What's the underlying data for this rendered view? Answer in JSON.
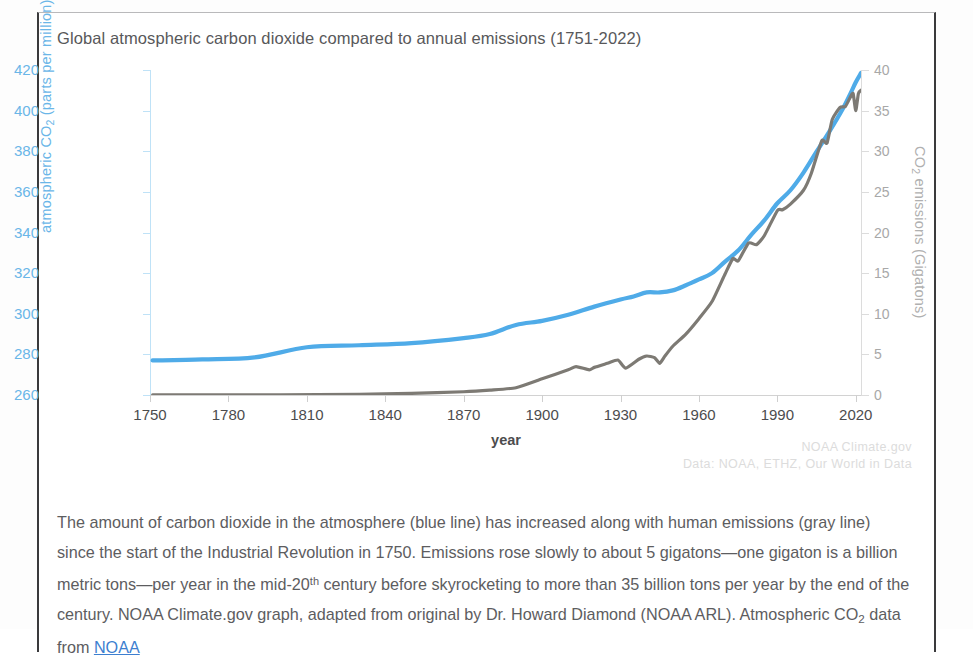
{
  "chart_data": {
    "type": "line",
    "title": "Global atmospheric carbon dioxide compared to annual emissions (1751-2022)",
    "xlabel": "year",
    "ylabel_left": "atmospheric CO₂ (parts per million)",
    "ylabel_right": "CO₂ emissions (Gigatons)",
    "xlim": [
      1750,
      2022
    ],
    "ylim_left": [
      260,
      420
    ],
    "ylim_right": [
      0,
      40
    ],
    "xticks": [
      1750,
      1780,
      1810,
      1840,
      1870,
      1900,
      1930,
      1960,
      1990,
      2020
    ],
    "yticks_left": [
      260,
      280,
      300,
      320,
      340,
      360,
      380,
      400,
      420
    ],
    "yticks_right": [
      0,
      5,
      10,
      15,
      20,
      25,
      30,
      35,
      40
    ],
    "grid": false,
    "legend_position": "none",
    "colors": {
      "co2_line": "#4FABE8",
      "emissions_line": "#7d7a74",
      "left_axis": "#6ab6e8",
      "right_axis": "#b0b0b0"
    },
    "series": [
      {
        "name": "atmospheric CO2 (ppm)",
        "axis": "left",
        "color": "#4FABE8",
        "x": [
          1751,
          1770,
          1790,
          1810,
          1830,
          1850,
          1870,
          1880,
          1890,
          1900,
          1910,
          1920,
          1930,
          1935,
          1940,
          1945,
          1950,
          1955,
          1960,
          1965,
          1970,
          1975,
          1980,
          1985,
          1990,
          1995,
          2000,
          2005,
          2010,
          2015,
          2018,
          2020,
          2022
        ],
        "y": [
          277,
          277.5,
          278.5,
          283.5,
          284.5,
          285.5,
          288,
          290,
          294.5,
          296.5,
          299.5,
          303.5,
          307,
          308.5,
          310.5,
          310.5,
          311.5,
          314,
          316.9,
          320,
          325.7,
          331.1,
          338.8,
          346,
          354.4,
          360.8,
          369.5,
          379.8,
          389.9,
          400.8,
          408.5,
          414,
          418.5
        ],
        "units": "parts per million"
      },
      {
        "name": "CO2 emissions (Gigatons)",
        "axis": "right",
        "color": "#7d7a74",
        "x": [
          1751,
          1800,
          1830,
          1850,
          1870,
          1880,
          1890,
          1900,
          1910,
          1913,
          1918,
          1920,
          1925,
          1929,
          1932,
          1937,
          1940,
          1943,
          1945,
          1947,
          1950,
          1955,
          1960,
          1965,
          1970,
          1973,
          1975,
          1979,
          1982,
          1985,
          1990,
          1992,
          1995,
          2000,
          2003,
          2007,
          2009,
          2011,
          2014,
          2016,
          2018,
          2019,
          2020,
          2021,
          2022
        ],
        "y": [
          0.01,
          0.03,
          0.08,
          0.2,
          0.4,
          0.6,
          0.9,
          2.0,
          3.1,
          3.5,
          3.1,
          3.4,
          3.9,
          4.3,
          3.3,
          4.4,
          4.8,
          4.6,
          3.9,
          4.8,
          6.0,
          7.5,
          9.4,
          11.5,
          14.9,
          16.8,
          16.5,
          18.7,
          18.5,
          19.6,
          22.7,
          22.8,
          23.5,
          25.2,
          27.3,
          31.3,
          31.0,
          33.9,
          35.4,
          35.5,
          36.7,
          37.1,
          35.0,
          37.1,
          37.5
        ],
        "units": "Gigatons"
      }
    ],
    "annotations": {
      "credit_line1": "NOAA Climate.gov",
      "credit_line2": "Data: NOAA, ETHZ, Our World in Data"
    }
  },
  "caption": {
    "part1": "The amount of carbon dioxide in the atmosphere (blue line) has increased along with human emissions (gray line) since the start of the Industrial Revolution in 1750. Emissions rose slowly to about 5 gigatons",
    "dash1": "—",
    "part2": "one gigaton is a billion metric tons",
    "dash2": "—",
    "part3": "per year in the mid-20",
    "sup": "th",
    "part4": " century before skyrocketing to more than 35 billion tons per year by the end of the century. NOAA Climate.gov graph, adapted from original by Dr. Howard Diamond (NOAA ARL). Atmospheric CO",
    "sub": "2",
    "part5": " data from ",
    "link": "NOAA"
  }
}
